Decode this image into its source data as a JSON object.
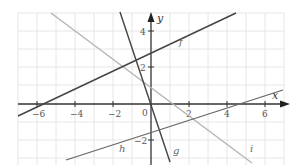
{
  "axes": {
    "x_label": "x",
    "y_label": "y",
    "origin_label": "0",
    "x_ticks": [
      "−6",
      "−4",
      "−2",
      "2",
      "4",
      "6"
    ],
    "y_ticks": [
      "4",
      "2",
      "−2"
    ]
  },
  "lines": [
    {
      "name": "f",
      "label": "f",
      "equation": "y = 0.5x + 3",
      "color": "#444444"
    },
    {
      "name": "g",
      "label": "g",
      "equation": "y = -3x",
      "color": "#444444"
    },
    {
      "name": "h",
      "label": "h",
      "equation": "y = x/3 - 1.5",
      "color": "#666666"
    },
    {
      "name": "i",
      "label": "i",
      "equation": "y = -0.75x + 1",
      "color": "#b0b0b0"
    }
  ],
  "grid": {
    "x_range": [
      -7,
      7
    ],
    "y_range": [
      -3,
      5
    ],
    "color": "#e6e6e6"
  }
}
